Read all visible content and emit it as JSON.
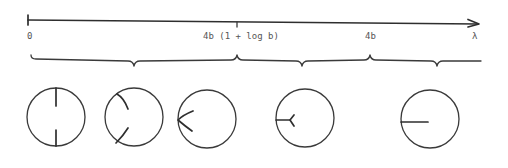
{
  "diagram": {
    "colors": {
      "ink": "#3a3a3a",
      "label": "#555555",
      "background": "#ffffff"
    },
    "axis": {
      "variable": "λ",
      "ticks": [
        {
          "label": "0",
          "x": 29
        },
        {
          "label": "4b (1 + log b)",
          "x": 237
        },
        {
          "label": "4b",
          "x": 370
        }
      ],
      "arrow_label": "λ"
    },
    "intervals": [
      {
        "from": "0",
        "to": "4b (1 + log b)",
        "circle_indices": [
          0,
          1,
          2
        ]
      },
      {
        "from": "4b (1 + log b)",
        "to": "4b",
        "circle_indices": [
          3
        ]
      },
      {
        "from": "4b",
        "to": "λ",
        "circle_indices": [
          4
        ]
      }
    ],
    "circles": [
      {
        "id": "circle-1",
        "description": "two radial segments from top and bottom boundary pointing toward center"
      },
      {
        "id": "circle-2",
        "description": "two curved segments from upper-left and lower-left boundary bending toward center"
      },
      {
        "id": "circle-3",
        "description": "two segments meeting at a point on the left boundary forming a V"
      },
      {
        "id": "circle-4",
        "description": "single segment from left boundary ending in a Y-shaped fork"
      },
      {
        "id": "circle-5",
        "description": "single radial segment from left boundary toward center"
      }
    ]
  }
}
